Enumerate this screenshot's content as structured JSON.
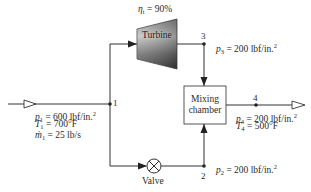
{
  "diagram": {
    "type": "thermodynamic-flow-schematic",
    "components": {
      "turbine": {
        "label": "Turbine",
        "efficiency_symbol": "η",
        "efficiency_sub": "t",
        "efficiency_value": "= 90%"
      },
      "mixing_chamber": {
        "line1": "Mixing",
        "line2": "chamber"
      },
      "valve": {
        "label": "Valve"
      }
    },
    "nodes": {
      "n1": "1",
      "n2": "2",
      "n3": "3",
      "n4": "4"
    },
    "state1": {
      "p_sym": "p",
      "p_sub": "1",
      "p_val": "= 600 lbf/in.",
      "p_exp": "2",
      "T_sym": "T",
      "T_sub": "1",
      "T_val": "= 700°F",
      "m_sym": "ṁ",
      "m_sub": "1",
      "m_val": "= 25 lb/s"
    },
    "state2": {
      "p_sym": "p",
      "p_sub": "2",
      "p_val": "= 200 lbf/in.",
      "p_exp": "2"
    },
    "state3": {
      "p_sym": "p",
      "p_sub": "3",
      "p_val": "= 200 lbf/in.",
      "p_exp": "2"
    },
    "state4": {
      "p_sym": "p",
      "p_sub": "4",
      "p_val": "= 200 lbf/in.",
      "p_exp": "2",
      "T_sym": "T",
      "T_sub": "4",
      "T_val": "= 500°F"
    },
    "colors": {
      "line": "#333333",
      "turbine_dark": "#4a4a4a",
      "turbine_light": "#b8b8b8"
    }
  }
}
